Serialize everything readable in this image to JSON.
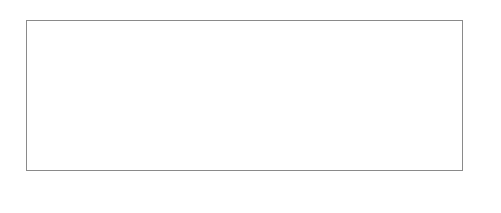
{
  "chart": {
    "total_columns": 44,
    "total_rows": 15,
    "repeat_start_column": 28,
    "repeat_width": 16,
    "colors": {
      "dark": "#5a5a5a",
      "light": "#ffffff",
      "gridline": "#bdbdbd"
    },
    "repeat_rows_top_to_bottom": [
      {
        "row": 15,
        "dark": [
          2,
          4,
          8,
          12,
          14
        ]
      },
      {
        "row": 14,
        "dark": [
          1,
          4,
          5,
          11,
          12,
          15
        ]
      },
      {
        "row": 13,
        "dark": [
          0,
          4,
          5,
          6,
          10,
          11,
          12
        ]
      },
      {
        "row": 12,
        "dark": [
          1,
          2,
          3,
          5,
          6,
          7,
          9,
          10,
          11,
          13,
          14,
          15
        ]
      },
      {
        "row": 11,
        "dark": [
          2,
          3,
          4,
          6,
          7,
          9,
          10,
          12,
          13,
          14
        ]
      },
      {
        "row": 10,
        "dark": [
          0,
          3,
          4,
          5,
          7,
          8,
          9,
          11,
          12,
          13
        ]
      },
      {
        "row": 9,
        "dark": [
          1,
          4,
          5,
          6,
          8,
          10,
          11,
          12,
          15
        ]
      },
      {
        "row": 8,
        "dark": [
          2,
          7,
          9,
          14
        ]
      },
      {
        "row": 7,
        "dark": [
          1,
          4,
          5,
          6,
          8,
          10,
          11,
          12,
          15
        ]
      },
      {
        "row": 6,
        "dark": [
          0,
          3,
          4,
          5,
          7,
          8,
          9,
          11,
          12,
          13
        ]
      },
      {
        "row": 5,
        "dark": [
          2,
          3,
          4,
          6,
          7,
          9,
          10,
          12,
          13,
          14
        ]
      },
      {
        "row": 4,
        "dark": [
          1,
          2,
          3,
          5,
          6,
          7,
          9,
          10,
          11,
          13,
          14,
          15
        ]
      },
      {
        "row": 3,
        "dark": [
          0,
          4,
          5,
          6,
          10,
          11,
          12
        ]
      },
      {
        "row": 2,
        "dark": [
          1,
          4,
          5,
          11,
          12,
          15
        ]
      },
      {
        "row": 1,
        "dark": [
          2,
          4,
          8,
          12,
          14
        ]
      }
    ],
    "row_labels": [
      "15",
      "13",
      "11",
      "9",
      "7",
      "5",
      "3",
      "1"
    ],
    "caption": "Rep 16 sts x 15 rows"
  }
}
